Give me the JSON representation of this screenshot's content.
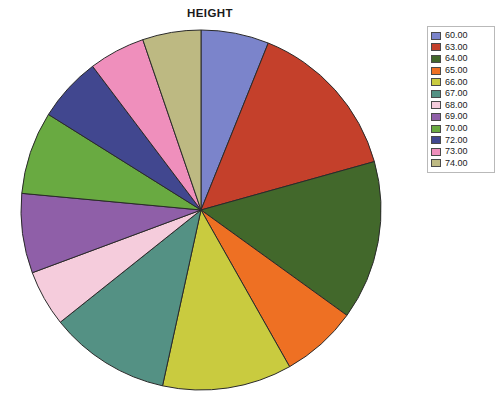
{
  "chart_data": {
    "type": "pie",
    "title": "HEIGHT",
    "xlabel": "",
    "ylabel": "",
    "legend_position": "right",
    "grid": false,
    "categories": [
      "60.00",
      "63.00",
      "64.00",
      "65.00",
      "66.00",
      "67.00",
      "68.00",
      "69.00",
      "70.00",
      "72.00",
      "73.00",
      "74.00"
    ],
    "values": [
      6.4,
      15.3,
      15.0,
      7.2,
      12.2,
      11.4,
      5.3,
      7.5,
      7.8,
      6.1,
      5.3,
      5.5
    ],
    "colors": [
      "#7b84cb",
      "#c4402b",
      "#42682b",
      "#ee7023",
      "#c9cb3f",
      "#549184",
      "#f5ccdc",
      "#8f5fa8",
      "#69aa41",
      "#41478f",
      "#ef8fbc",
      "#bdb982"
    ],
    "slices": [
      {
        "label": "60.00",
        "value": 6.4,
        "color": "#7b84cb"
      },
      {
        "label": "63.00",
        "value": 15.3,
        "color": "#c4402b"
      },
      {
        "label": "64.00",
        "value": 15.0,
        "color": "#42682b"
      },
      {
        "label": "65.00",
        "value": 7.2,
        "color": "#ee7023"
      },
      {
        "label": "66.00",
        "value": 12.2,
        "color": "#c9cb3f"
      },
      {
        "label": "67.00",
        "value": 11.4,
        "color": "#549184"
      },
      {
        "label": "68.00",
        "value": 5.3,
        "color": "#f5ccdc"
      },
      {
        "label": "69.00",
        "value": 7.5,
        "color": "#8f5fa8"
      },
      {
        "label": "70.00",
        "value": 7.8,
        "color": "#69aa41"
      },
      {
        "label": "72.00",
        "value": 6.1,
        "color": "#41478f"
      },
      {
        "label": "73.00",
        "value": 5.3,
        "color": "#ef8fbc"
      },
      {
        "label": "74.00",
        "value": 5.5,
        "color": "#bdb982"
      }
    ],
    "geometry": {
      "center_x": 201,
      "center_y": 210,
      "radius": 180,
      "start_angle_deg": -90,
      "direction": "clockwise"
    },
    "style": {
      "slice_border_color": "#2a2a2a",
      "slice_border_width": 1,
      "background": "#ffffff",
      "legend_border": "#b9b9b9"
    }
  },
  "legend": {
    "items": [
      {
        "label": "60.00",
        "color": "#7b84cb"
      },
      {
        "label": "63.00",
        "color": "#c4402b"
      },
      {
        "label": "64.00",
        "color": "#42682b"
      },
      {
        "label": "65.00",
        "color": "#ee7023"
      },
      {
        "label": "66.00",
        "color": "#c9cb3f"
      },
      {
        "label": "67.00",
        "color": "#549184"
      },
      {
        "label": "68.00",
        "color": "#f5ccdc"
      },
      {
        "label": "69.00",
        "color": "#8f5fa8"
      },
      {
        "label": "70.00",
        "color": "#69aa41"
      },
      {
        "label": "72.00",
        "color": "#41478f"
      },
      {
        "label": "73.00",
        "color": "#ef8fbc"
      },
      {
        "label": "74.00",
        "color": "#bdb982"
      }
    ]
  }
}
